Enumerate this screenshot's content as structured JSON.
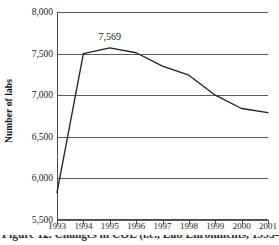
{
  "chart_data": {
    "type": "line",
    "title": "",
    "subtitle": "",
    "xlabel": "",
    "ylabel": "Number of labs",
    "categories": [
      "1993",
      "1994",
      "1995",
      "1996",
      "1997",
      "1998",
      "1999",
      "2000",
      "2001"
    ],
    "x": [
      1993,
      1994,
      1995,
      1996,
      1997,
      1998,
      1999,
      2000,
      2001
    ],
    "values": [
      5830,
      7500,
      7569,
      7510,
      7350,
      7240,
      7000,
      6840,
      6790
    ],
    "series": [
      {
        "name": "Number of labs",
        "values": [
          5830,
          7500,
          7569,
          7510,
          7350,
          7240,
          7000,
          6840,
          6790
        ],
        "color": "#232323"
      }
    ],
    "ylim": [
      5500,
      8000
    ],
    "xlim": [
      1993,
      2001
    ],
    "yticks": [
      5500,
      6000,
      6500,
      7000,
      7500,
      8000
    ],
    "ytick_labels": [
      "5,500",
      "6,000",
      "6,500",
      "7,000",
      "7,500",
      "8,000"
    ],
    "xticks": [
      1993,
      1994,
      1995,
      1996,
      1997,
      1998,
      1999,
      2000,
      2001
    ],
    "xtick_labels": [
      "1993",
      "1994",
      "1995",
      "1996",
      "1997",
      "1998",
      "1999",
      "2000",
      "2001"
    ],
    "grid": "horizontal",
    "grid_color": "#5b5b5b",
    "legend": "none",
    "annotations": [
      {
        "text": "7,569",
        "x": 1995,
        "y": 7569,
        "position": "above-point"
      }
    ]
  },
  "axes": {
    "y_title": "Number of labs",
    "y_tick_labels": [
      "8,000",
      "7,500",
      "7,000",
      "6,500",
      "6,000",
      "5,500"
    ],
    "x_tick_labels": [
      "1993",
      "1994",
      "1995",
      "1996",
      "1997",
      "1998",
      "1999",
      "2000",
      "2001"
    ]
  },
  "annotation": {
    "peak_label": "7,569"
  },
  "caption": {
    "text": "Figure 12. Changes in COL (i.e., Lab Enrollments, 1993–2001"
  }
}
